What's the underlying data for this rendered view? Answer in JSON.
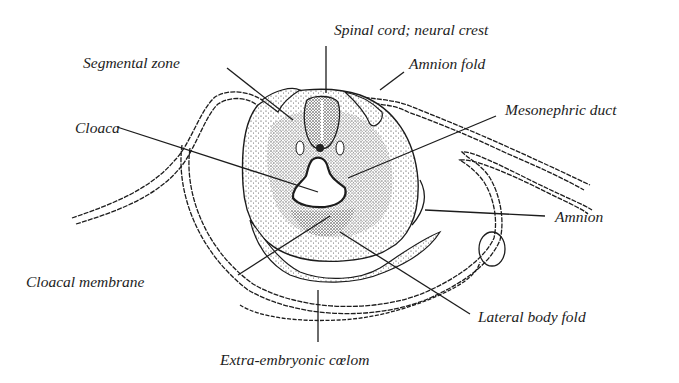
{
  "figure": {
    "type": "embryo cross-section illustration",
    "colors": {
      "ink": "#1c1c1c",
      "background": "#ffffff"
    }
  },
  "labels": {
    "spinal_cord": "Spinal cord; neural crest",
    "segmental_zone": "Segmental zone",
    "amnion_fold": "Amnion fold",
    "mesonephric_duct": "Mesonephric duct",
    "cloaca": "Cloaca",
    "amnion": "Amnion",
    "cloacal_membrane": "Cloacal membrane",
    "lateral_body_fold": "Lateral body fold",
    "extra_embryonic_coelom": "Extra-embryonic cœlom"
  }
}
